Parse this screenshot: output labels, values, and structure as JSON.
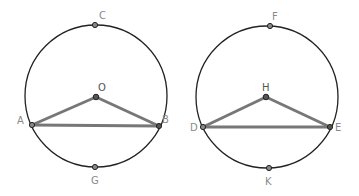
{
  "colors": {
    "circle": "#222222",
    "segment": "#777777",
    "point_fill": "#888888",
    "point_stroke": "#222222",
    "label": "#8a8a8a"
  },
  "figures": [
    {
      "circle": {
        "cx": 96,
        "cy": 96,
        "r": 71
      },
      "center": {
        "label": "O",
        "x": 96,
        "y": 97
      },
      "chord_points": [
        {
          "label": "A",
          "x": 32,
          "y": 125
        },
        {
          "label": "B",
          "x": 159,
          "y": 126
        }
      ],
      "top_point": {
        "label": "C",
        "x": 95,
        "y": 25
      },
      "bottom_point": {
        "label": "G",
        "x": 95,
        "y": 167
      }
    },
    {
      "circle": {
        "cx": 267,
        "cy": 97,
        "r": 71
      },
      "center": {
        "label": "H",
        "x": 266,
        "y": 97
      },
      "chord_points": [
        {
          "label": "D",
          "x": 203,
          "y": 127
        },
        {
          "label": "E",
          "x": 330,
          "y": 127
        }
      ],
      "top_point": {
        "label": "F",
        "x": 270,
        "y": 26
      },
      "bottom_point": {
        "label": "K",
        "x": 269,
        "y": 168
      }
    }
  ]
}
